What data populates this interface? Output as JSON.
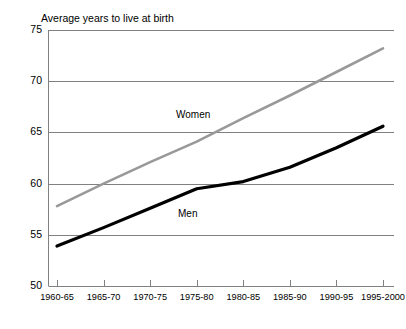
{
  "chart_data": {
    "type": "line",
    "title": "Average years to live at birth",
    "xlabel": "",
    "ylabel": "",
    "ylim": [
      50,
      75
    ],
    "yticks": [
      50,
      55,
      60,
      65,
      70,
      75
    ],
    "grid": true,
    "legend_position": "inline-labels",
    "categories": [
      "1960-65",
      "1965-70",
      "1970-75",
      "1975-80",
      "1980-85",
      "1985-90",
      "1990-95",
      "1995-2000"
    ],
    "series": [
      {
        "name": "Women",
        "color": "#999999",
        "values": [
          57.8,
          60.0,
          62.1,
          64.1,
          66.4,
          68.6,
          70.9,
          73.2
        ]
      },
      {
        "name": "Men",
        "color": "#000000",
        "values": [
          53.9,
          55.7,
          57.6,
          59.5,
          60.2,
          61.6,
          63.5,
          65.6
        ]
      }
    ]
  },
  "axis": {
    "ytick_labels": [
      "75",
      "70",
      "65",
      "60",
      "55",
      "50"
    ],
    "xtick_labels": [
      "1960-65",
      "1965-70",
      "1970-75",
      "1975-80",
      "1980-85",
      "1985-90",
      "1990-95",
      "1995-2000"
    ]
  },
  "colors": {
    "women_line": "#999999",
    "men_line": "#000000",
    "gridline": "#808080",
    "axis": "#808080"
  }
}
